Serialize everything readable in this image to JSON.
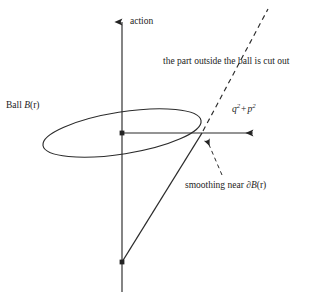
{
  "figure": {
    "kind": "mathematical-diagram",
    "background_color": "#ffffff",
    "ink_color": "#232323",
    "axes": {
      "vertical_label": "action",
      "horizontal_label_parts": {
        "q": "q",
        "q_exponent": "2",
        "operator": "+",
        "p": "p",
        "p_exponent": "2"
      },
      "horizontal_label_plain": "q2 + p2"
    },
    "labels": {
      "ball": {
        "prefix": "Ball",
        "symbol": "B",
        "argument": "(r)",
        "plain": "Ball B(r)"
      },
      "cut_out": "the part outside the ball is cut out",
      "smoothing": {
        "prefix": "smoothing near",
        "symbol_partial": "∂",
        "symbol_B": "B",
        "argument": "(r)",
        "plain": "smoothing near ∂B(r)"
      }
    },
    "elements": {
      "ellipse_name": "Ball B(r)",
      "dashed_line_name": "cone-extension-dashed",
      "solid_line_name": "cone-generator-solid",
      "origin_marker": "origin-dot",
      "apex_marker": "cone-apex-dot",
      "intersection_marker": "boundary-intersection-point"
    }
  }
}
